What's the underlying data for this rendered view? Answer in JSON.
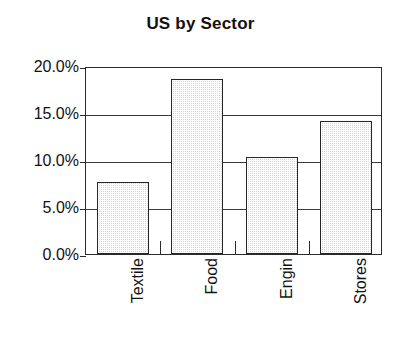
{
  "chart_data": {
    "type": "bar",
    "title": "US by Sector",
    "xlabel": "",
    "ylabel": "",
    "categories": [
      "Textile",
      "Food",
      "Engin",
      "Stores"
    ],
    "values": [
      7.7,
      18.6,
      10.3,
      14.2
    ],
    "value_unit": "%",
    "ylim": [
      0.0,
      20.0
    ],
    "ytick_values": [
      0.0,
      5.0,
      10.0,
      15.0,
      20.0
    ],
    "ytick_labels": [
      "0.0%",
      "5.0%",
      "10.0%",
      "15.0%",
      "20.0%"
    ],
    "grid": "horizontal",
    "legend": "none",
    "bar_fill_color": "#d6d6d6",
    "bar_border_color": "#262626",
    "axis_color": "#2b2b2b",
    "background_color": "#ffffff",
    "text_color": "#121212",
    "xtick_label_rotation": 90
  },
  "axis": {
    "y_labels": [
      {
        "text": "20.0%",
        "value": 20.0
      },
      {
        "text": "15.0%",
        "value": 15.0
      },
      {
        "text": "10.0%",
        "value": 10.0
      },
      {
        "text": "5.0%",
        "value": 5.0
      },
      {
        "text": "0.0%",
        "value": 0.0
      }
    ],
    "x_labels": [
      {
        "text": "Textile"
      },
      {
        "text": "Food"
      },
      {
        "text": "Engin"
      },
      {
        "text": "Stores"
      }
    ]
  }
}
